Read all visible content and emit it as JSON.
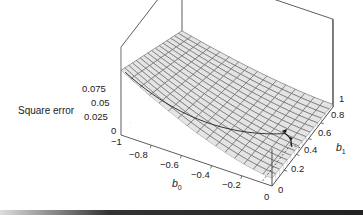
{
  "chart_data": {
    "type": "surface3d",
    "title": "",
    "zlabel": "Square error",
    "xlabel": "b0",
    "ylabel": "b1",
    "x_axis": {
      "name": "b0",
      "range": [
        -1,
        0
      ],
      "ticks": [
        "-1",
        "-0.8",
        "-0.6",
        "-0.4",
        "-0.2",
        "0"
      ]
    },
    "y_axis": {
      "name": "b1",
      "range": [
        0,
        1
      ],
      "ticks": [
        "0",
        "0.2",
        "0.4",
        "0.6",
        "0.8",
        "1"
      ]
    },
    "z_axis": {
      "name": "Square error",
      "range": [
        0,
        0.085
      ],
      "ticks": [
        "0",
        "0.025",
        "0.05",
        "0.075"
      ]
    },
    "grid_resolution": [
      16,
      16
    ],
    "surface_description": "Shaded square-error surface over (b0, b1); highest (~0.075) near b0=-1,b1=0 and decreasing toward b0=0; nearly flat, low values near b0=0,b1=1",
    "annotations": [
      {
        "type": "path",
        "description": "descent path drawn on surface from (b0=-1,b1=0) toward minimum"
      },
      {
        "type": "arrow",
        "description": "arrows near b0≈-0.1, b1≈0.5 indicating gradient step"
      },
      {
        "type": "dashed-projection",
        "description": "dashed lines projecting a point onto the base plane"
      }
    ],
    "grid": true,
    "legend": null
  },
  "labels": {
    "z_title": "Square error",
    "z_ticks": [
      "0.075",
      "0.05",
      "0.025",
      "0"
    ],
    "b0_ticks": [
      "−1",
      "−0.8",
      "−0.6",
      "−0.4",
      "−0.2",
      "0"
    ],
    "b1_ticks": [
      "0",
      "0.2",
      "0.4",
      "0.6",
      "0.8",
      "1"
    ],
    "b0_name": "b",
    "b0_sub": "0",
    "b1_name": "b",
    "b1_sub": "1",
    "corner_zero": "0"
  }
}
